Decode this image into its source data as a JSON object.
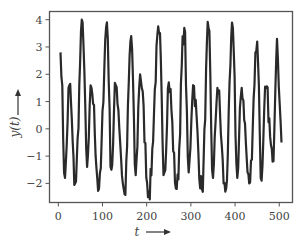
{
  "chart_data": {
    "type": "line",
    "title": "",
    "xlabel": "t",
    "ylabel": "y(t)",
    "xlabel_arrow": "right",
    "ylabel_arrow": "up",
    "xlim": [
      -20,
      530
    ],
    "ylim": [
      -2.7,
      4.3
    ],
    "xticks": [
      0,
      100,
      200,
      300,
      400,
      500
    ],
    "yticks": [
      -2,
      -1,
      0,
      1,
      2,
      3,
      4
    ],
    "grid": false,
    "legend": null,
    "line_color": "#2a2a2a",
    "series": [
      {
        "name": "y(t)",
        "peaks_approx": [
          {
            "t": 5,
            "y": 2.8
          },
          {
            "t": 25,
            "y": 1.6
          },
          {
            "t": 55,
            "y": 3.9
          },
          {
            "t": 75,
            "y": 1.5
          },
          {
            "t": 110,
            "y": 3.9
          },
          {
            "t": 130,
            "y": 1.6
          },
          {
            "t": 165,
            "y": 3.4
          },
          {
            "t": 185,
            "y": 2.0
          },
          {
            "t": 228,
            "y": 3.5
          },
          {
            "t": 250,
            "y": 1.7
          },
          {
            "t": 285,
            "y": 3.7
          },
          {
            "t": 305,
            "y": 1.6
          },
          {
            "t": 340,
            "y": 3.7
          },
          {
            "t": 360,
            "y": 1.5
          },
          {
            "t": 395,
            "y": 3.7
          },
          {
            "t": 415,
            "y": 1.5
          },
          {
            "t": 450,
            "y": 3.2
          },
          {
            "t": 470,
            "y": 1.5
          },
          {
            "t": 495,
            "y": 3.3
          }
        ],
        "troughs_approx": [
          {
            "t": 15,
            "y": -1.8
          },
          {
            "t": 38,
            "y": -2.0
          },
          {
            "t": 65,
            "y": -1.4
          },
          {
            "t": 92,
            "y": -2.2
          },
          {
            "t": 120,
            "y": -1.5
          },
          {
            "t": 150,
            "y": -2.4
          },
          {
            "t": 175,
            "y": -1.7
          },
          {
            "t": 205,
            "y": -2.3
          },
          {
            "t": 240,
            "y": -1.6
          },
          {
            "t": 268,
            "y": -2.2
          },
          {
            "t": 295,
            "y": -1.6
          },
          {
            "t": 325,
            "y": -2.2
          },
          {
            "t": 350,
            "y": -1.8
          },
          {
            "t": 378,
            "y": -2.3
          },
          {
            "t": 405,
            "y": -1.8
          },
          {
            "t": 432,
            "y": -2.0
          },
          {
            "t": 460,
            "y": -1.9
          },
          {
            "t": 485,
            "y": -1.2
          },
          {
            "t": 505,
            "y": -0.5
          }
        ]
      }
    ]
  }
}
